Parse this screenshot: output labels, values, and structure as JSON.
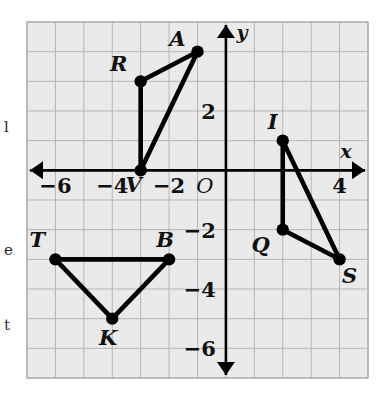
{
  "figure": {
    "type": "coordinate-plane",
    "background_color": "#eaeaea",
    "grid_line_color": "#b5b5b5",
    "axis_color": "#000000",
    "shape_color": "#000000",
    "grid": {
      "x_min": -7,
      "x_max": 5,
      "y_min": -7,
      "y_max": 5,
      "cell_size": 1,
      "show_grid": true
    },
    "axes": {
      "x_axis_name": "x",
      "y_axis_name": "y",
      "origin_label": "O",
      "x_tick_labels": [
        {
          "value": -6,
          "text": "−6"
        },
        {
          "value": -4,
          "text": "−4"
        },
        {
          "value": -2,
          "text": "−2"
        },
        {
          "value": 4,
          "text": "4"
        }
      ],
      "y_tick_labels": [
        {
          "value": 2,
          "text": "2"
        },
        {
          "value": -2,
          "text": "−2"
        },
        {
          "value": -4,
          "text": "−4"
        },
        {
          "value": -6,
          "text": "−6"
        }
      ]
    },
    "shapes": [
      {
        "name": "triangle-rav",
        "closed": true,
        "vertices": [
          {
            "label": "R",
            "x": -3,
            "y": 3,
            "label_dx": -22,
            "label_dy": -10
          },
          {
            "label": "A",
            "x": -1,
            "y": 4,
            "label_dx": -20,
            "label_dy": -6
          },
          {
            "label": "V",
            "x": -3,
            "y": 0,
            "label_dx": -7,
            "label_dy": 22
          }
        ]
      },
      {
        "name": "triangle-iqs",
        "closed": true,
        "vertices": [
          {
            "label": "I",
            "x": 2,
            "y": 1,
            "label_dx": -10,
            "label_dy": -12
          },
          {
            "label": "Q",
            "x": 2,
            "y": -2,
            "label_dx": -22,
            "label_dy": 22
          },
          {
            "label": "S",
            "x": 4,
            "y": -3,
            "label_dx": 10,
            "label_dy": 24
          }
        ]
      },
      {
        "name": "triangle-tbk",
        "closed": true,
        "vertices": [
          {
            "label": "T",
            "x": -6,
            "y": -3,
            "label_dx": -18,
            "label_dy": -12
          },
          {
            "label": "B",
            "x": -2,
            "y": -3,
            "label_dx": -4,
            "label_dy": -12
          },
          {
            "label": "K",
            "x": -4,
            "y": -5,
            "label_dx": -4,
            "label_dy": 26
          }
        ]
      }
    ]
  },
  "margin_text": {
    "glyphs": [
      {
        "text": "l",
        "x": 4,
        "y": 120
      },
      {
        "text": "e",
        "x": 4,
        "y": 243
      },
      {
        "text": "t",
        "x": 4,
        "y": 318
      }
    ]
  }
}
